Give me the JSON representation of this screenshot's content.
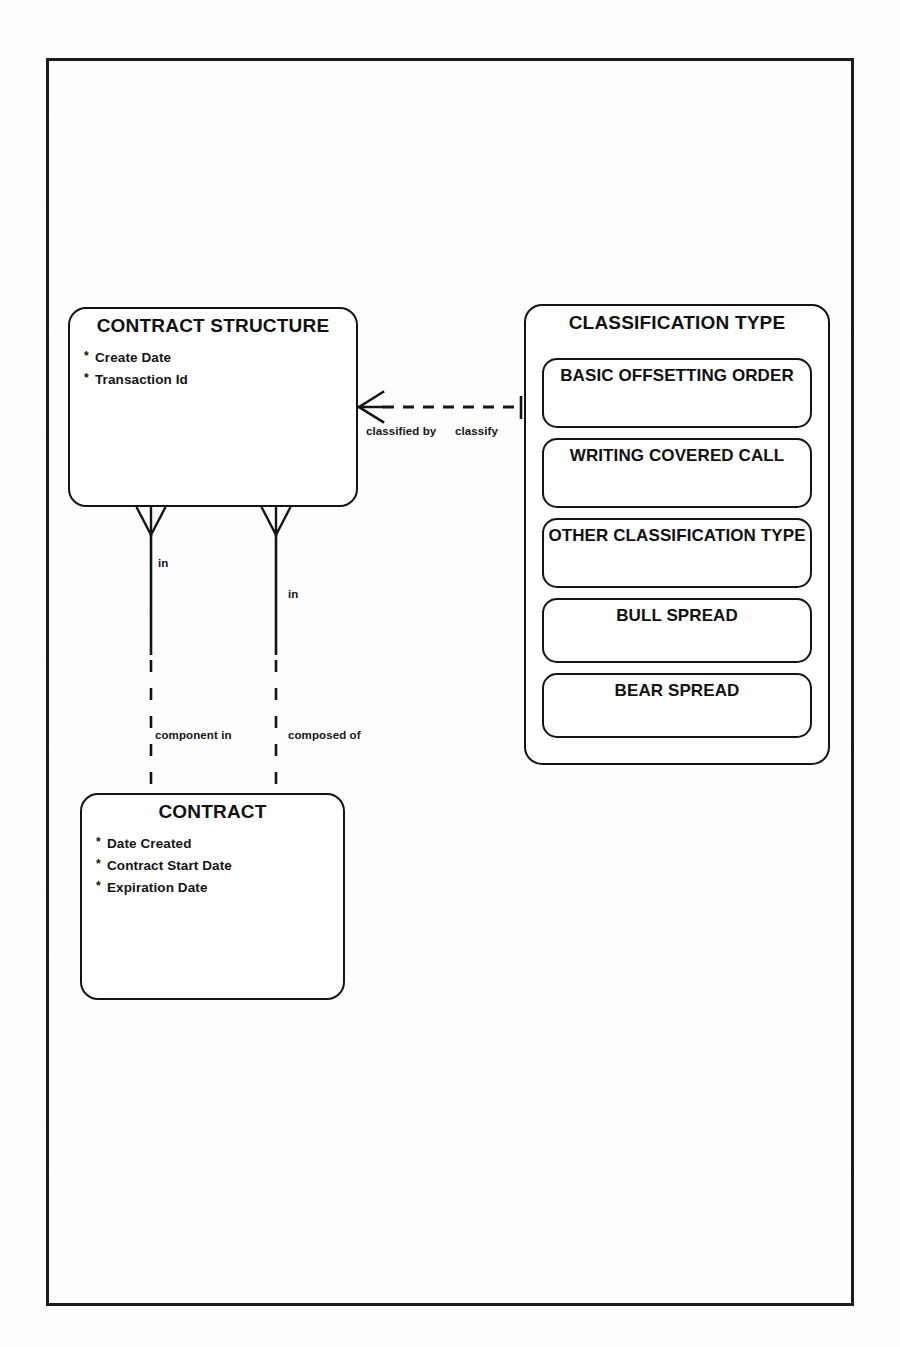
{
  "diagram": {
    "notation": "crows-foot",
    "line_color": "#141414",
    "background_color": "#fefefe"
  },
  "entities": {
    "contract_structure": {
      "name": "CONTRACT STRUCTURE",
      "attributes": [
        {
          "marker": "*",
          "label": "Create Date"
        },
        {
          "marker": "*",
          "label": "Transaction Id"
        }
      ]
    },
    "contract": {
      "name": "CONTRACT",
      "attributes": [
        {
          "marker": "*",
          "label": "Date Created"
        },
        {
          "marker": "*",
          "label": "Contract Start Date"
        },
        {
          "marker": "*",
          "label": "Expiration Date"
        }
      ]
    },
    "classification_type": {
      "name": "CLASSIFICATION TYPE",
      "subtypes": [
        {
          "label": "BASIC OFFSETTING ORDER"
        },
        {
          "label": "WRITING COVERED CALL"
        },
        {
          "label": "OTHER CLASSIFICATION TYPE"
        },
        {
          "label": "BULL SPREAD"
        },
        {
          "label": "BEAR SPREAD"
        }
      ]
    }
  },
  "relationships": [
    {
      "id": "classify",
      "from": "contract_structure",
      "to": "classification_type",
      "from_label": "classified by",
      "to_label": "classify",
      "style": "dashed",
      "from_end": "crows-foot",
      "to_end": "single"
    },
    {
      "id": "component",
      "from": "contract_structure",
      "to": "contract",
      "from_label": "in",
      "to_label": "component in",
      "style": "solid-then-dashed",
      "from_end": "crows-foot",
      "to_end": "single"
    },
    {
      "id": "composed",
      "from": "contract_structure",
      "to": "contract",
      "from_label": "in",
      "to_label": "composed of",
      "style": "solid-then-dashed",
      "from_end": "crows-foot",
      "to_end": "single"
    }
  ]
}
